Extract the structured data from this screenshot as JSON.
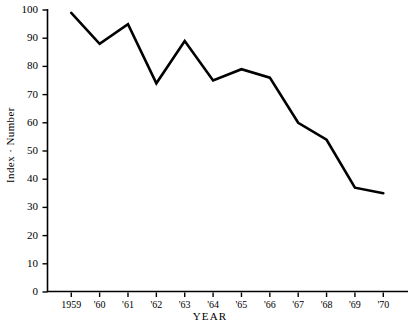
{
  "chart_data": {
    "type": "line",
    "title": "",
    "xlabel": "YEAR",
    "ylabel": "Index · Number",
    "categories": [
      "1959",
      "'60",
      "'61",
      "'62",
      "'63",
      "'64",
      "'65",
      "'66",
      "'67",
      "'68",
      "'69",
      "'70"
    ],
    "values": [
      99,
      88,
      95,
      74,
      89,
      75,
      79,
      76,
      60,
      54,
      37,
      35
    ],
    "ylim": [
      0,
      100
    ],
    "ytick_labels": [
      "0",
      "10",
      "20",
      "30",
      "40",
      "50",
      "60",
      "70",
      "80",
      "90",
      "100"
    ],
    "ytick_values": [
      0,
      10,
      20,
      30,
      40,
      50,
      60,
      70,
      80,
      90,
      100
    ],
    "grid": false,
    "legend": "none",
    "line_color": "#000000",
    "axis_color": "#000000",
    "background": "#ffffff",
    "series": [
      {
        "name": "Index Number",
        "values": [
          99,
          88,
          95,
          74,
          89,
          75,
          79,
          76,
          60,
          54,
          37,
          35
        ]
      }
    ]
  }
}
